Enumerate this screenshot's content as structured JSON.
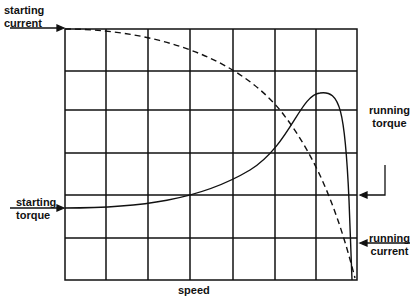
{
  "diagram": {
    "x_axis_label": "speed",
    "labels": {
      "starting_current": [
        "starting",
        "current"
      ],
      "starting_torque": [
        "starting",
        "torque"
      ],
      "running_torque": [
        "running",
        "torque"
      ],
      "running_current": [
        "running",
        "current"
      ]
    },
    "grid": {
      "columns": 7,
      "rows": 6
    },
    "colors": {
      "ink": "#111111",
      "background": "#ffffff"
    }
  }
}
